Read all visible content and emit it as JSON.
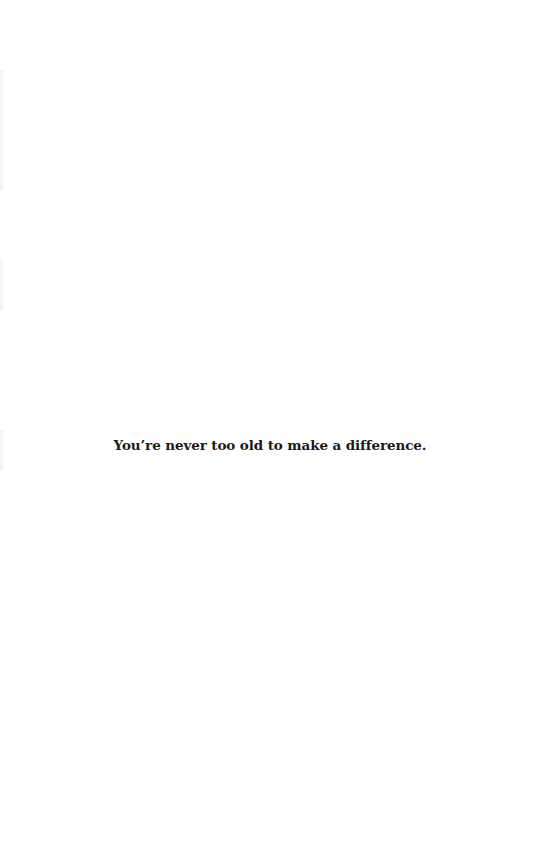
{
  "page": {
    "background": "#ffffff",
    "text_color": "#1a1a1a"
  },
  "content": {
    "tagline": "You’re never too old to make a difference."
  }
}
